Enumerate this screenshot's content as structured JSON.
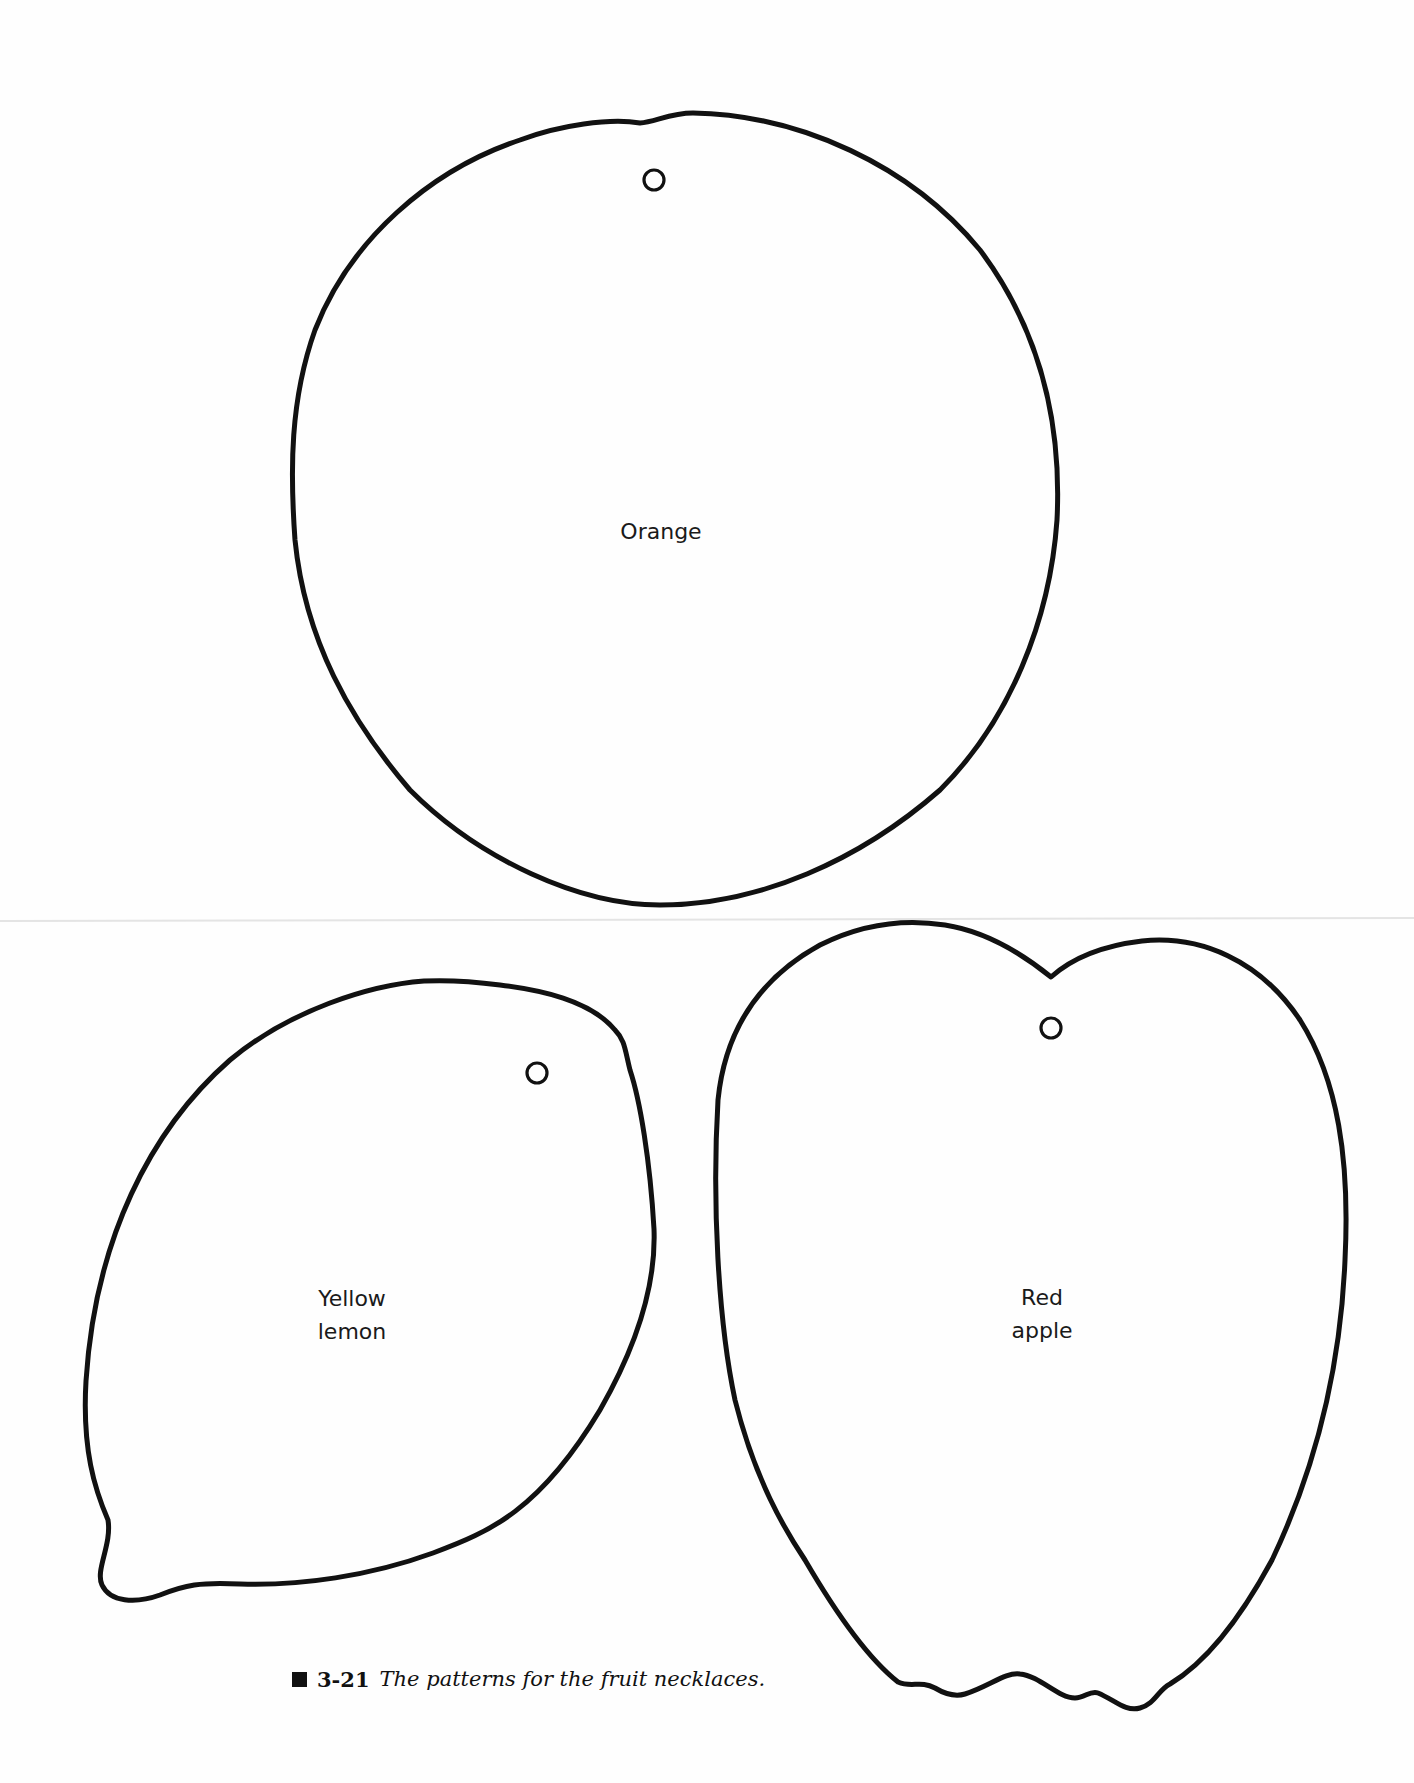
{
  "figure": {
    "number": "3-21",
    "caption": "The patterns for the fruit necklaces.",
    "marker_icon": "black-square"
  },
  "patterns": [
    {
      "id": "orange",
      "label_lines": [
        "Orange"
      ],
      "has_hole": true
    },
    {
      "id": "lemon",
      "label_lines": [
        "Yellow",
        "lemon"
      ],
      "has_hole": true
    },
    {
      "id": "apple",
      "label_lines": [
        "Red",
        "apple"
      ],
      "has_hole": true
    }
  ],
  "colors": {
    "ink": "#111111",
    "paper": "#fefefe"
  }
}
